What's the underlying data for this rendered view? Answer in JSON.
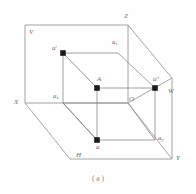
{
  "figure": {
    "caption": "( a )",
    "colors": {
      "outline": "#9a9a9a",
      "inner_line": "#8c8c8c",
      "diagonal": "#7d7d7d",
      "point_fill": "#1a1a1a",
      "label_text": "#6e6e6e",
      "background": "#fefefe"
    },
    "planes": [
      {
        "id": "V",
        "label": "V",
        "description": "vertical projection plane"
      },
      {
        "id": "H",
        "label": "H",
        "description": "horizontal projection plane"
      },
      {
        "id": "W",
        "label": "W",
        "description": "side projection plane"
      }
    ],
    "axes": [
      {
        "id": "X",
        "label": "X"
      },
      {
        "id": "Y",
        "label": "Y"
      },
      {
        "id": "Z",
        "label": "Z"
      }
    ],
    "origin": {
      "label": "O"
    },
    "points": [
      {
        "id": "A",
        "label": "A",
        "prime": "",
        "sub": "",
        "x": 97,
        "y": 88
      },
      {
        "id": "a_prime",
        "label": "a",
        "prime": "'",
        "sub": "",
        "x": 63,
        "y": 53
      },
      {
        "id": "a_dprime",
        "label": "a",
        "prime": "″",
        "sub": "",
        "x": 155,
        "y": 88
      },
      {
        "id": "a",
        "label": "a",
        "prime": "",
        "sub": "",
        "x": 97,
        "y": 140
      }
    ],
    "intercepts": [
      {
        "id": "a_z",
        "base": "a",
        "sub": "z"
      },
      {
        "id": "a_x",
        "base": "a",
        "sub": "x"
      },
      {
        "id": "a_y",
        "base": "a",
        "sub": "y"
      }
    ],
    "label_texts": {
      "V": "V",
      "H": "H",
      "W": "W",
      "X": "X",
      "Y": "Y",
      "Z": "Z",
      "O": "O",
      "A": "A",
      "a": "a",
      "a_prime": "a",
      "a_prime_mark": "′",
      "a_dprime": "a",
      "a_dprime_mark": "″",
      "a_base": "a",
      "sub_z": "z",
      "sub_x": "x",
      "sub_y": "y"
    }
  }
}
